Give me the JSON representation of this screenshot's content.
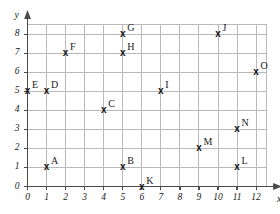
{
  "chart_data": {
    "type": "scatter",
    "title": "",
    "xlabel": "x",
    "ylabel": "y",
    "xlim": [
      0,
      12
    ],
    "ylim": [
      0,
      8
    ],
    "grid": true,
    "legend": "none",
    "x_ticks": [
      "0",
      "1",
      "2",
      "3",
      "4",
      "5",
      "6",
      "7",
      "8",
      "9",
      "10",
      "11",
      "12"
    ],
    "y_ticks": [
      "0",
      "1",
      "2",
      "3",
      "4",
      "5",
      "6",
      "7",
      "8"
    ],
    "marker": "x",
    "points": [
      {
        "label": "A",
        "x": 1,
        "y": 1
      },
      {
        "label": "B",
        "x": 5,
        "y": 1
      },
      {
        "label": "C",
        "x": 4,
        "y": 4
      },
      {
        "label": "D",
        "x": 1,
        "y": 5
      },
      {
        "label": "E",
        "x": 0,
        "y": 5
      },
      {
        "label": "F",
        "x": 2,
        "y": 7
      },
      {
        "label": "G",
        "x": 5,
        "y": 8
      },
      {
        "label": "H",
        "x": 5,
        "y": 7
      },
      {
        "label": "I",
        "x": 7,
        "y": 5
      },
      {
        "label": "J",
        "x": 10,
        "y": 8
      },
      {
        "label": "K",
        "x": 6,
        "y": 0
      },
      {
        "label": "L",
        "x": 11,
        "y": 1
      },
      {
        "label": "M",
        "x": 9,
        "y": 2
      },
      {
        "label": "N",
        "x": 11,
        "y": 3
      },
      {
        "label": "O",
        "x": 12,
        "y": 6
      }
    ]
  },
  "colors": {
    "grid": "#b9b9b9",
    "axis": "#4a4a4a",
    "marker": "#111111",
    "background": "#ffffff"
  }
}
